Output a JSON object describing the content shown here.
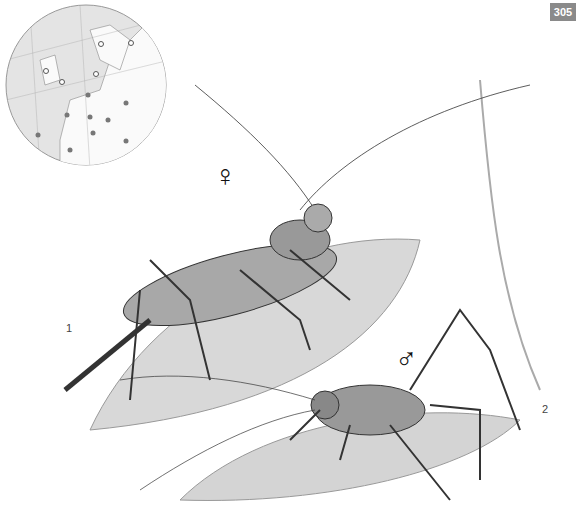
{
  "page_number": "305",
  "labels": {
    "female_symbol": "♀",
    "male_symbol": "♂",
    "figure_1": "1",
    "figure_2": "2"
  },
  "map": {
    "region": "Europe",
    "open_markers": 5,
    "filled_markers": 9
  },
  "colors": {
    "badge_bg": "#8a8a8a",
    "ink": "#333333",
    "leaf": "#c8c8c8"
  }
}
